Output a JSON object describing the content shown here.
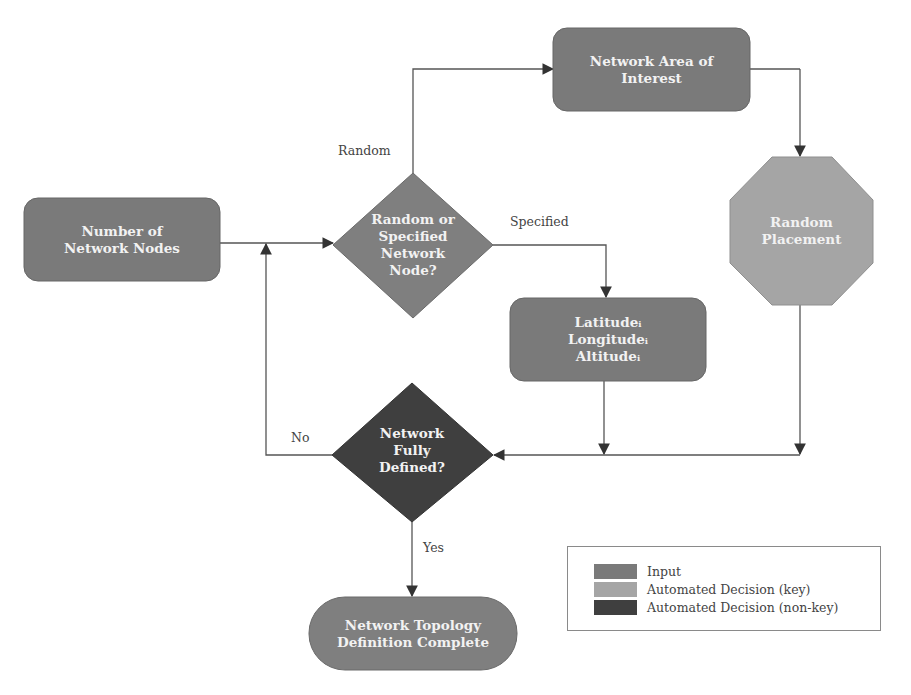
{
  "colors": {
    "input": "#7a7a7a",
    "automated_key": "#a5a5a5",
    "automated_nonkey": "#3f3f3f",
    "terminal": "#7f7f7f",
    "line": "#555555",
    "label_text": "#f2f2f2"
  },
  "nodes": {
    "number_of_nodes": {
      "label": "Number of\nNetwork Nodes",
      "type": "input"
    },
    "random_or_specified": {
      "label": "Random or\nSpecified\nNetwork\nNode?",
      "type": "input-decision"
    },
    "network_area": {
      "label": "Network Area of\nInterest",
      "type": "input"
    },
    "random_placement": {
      "label": "Random\nPlacement",
      "type": "automated_key"
    },
    "lat_long_alt": {
      "label": "Latitudeᵢ\nLongitudeᵢ\nAltitudeᵢ",
      "type": "input"
    },
    "fully_defined": {
      "label": "Network\nFully\nDefined?",
      "type": "automated_nonkey"
    },
    "complete": {
      "label": "Network Topology\nDefinition Complete",
      "type": "terminal"
    }
  },
  "edges": {
    "random": "Random",
    "specified": "Specified",
    "no": "No",
    "yes": "Yes"
  },
  "legend": {
    "items": [
      {
        "label": "Input",
        "color": "#7a7a7a"
      },
      {
        "label": "Automated Decision (key)",
        "color": "#a5a5a5"
      },
      {
        "label": "Automated Decision (non-key)",
        "color": "#3f3f3f"
      }
    ]
  }
}
